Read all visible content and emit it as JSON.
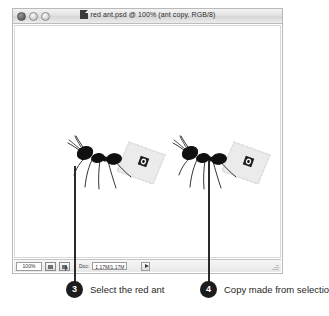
{
  "window": {
    "title": "red ant.psd @ 100% (ant copy, RGB/8)",
    "doc_icon": "photoshop-document-icon",
    "controls": [
      {
        "name": "close-button",
        "label": ""
      },
      {
        "name": "minimize-button",
        "label": ""
      },
      {
        "name": "zoom-button",
        "label": ""
      }
    ]
  },
  "statusbar": {
    "zoom_level": "100%",
    "doc_label": "Doc:",
    "doc_size": "1.17M/1.17M",
    "icons": [
      {
        "name": "preview-icon"
      },
      {
        "name": "export-icon"
      }
    ],
    "popup_arrow": "popup-menu-arrow-icon"
  },
  "canvas": {
    "objects": [
      {
        "name": "ant-original",
        "description": "red ant carrying perforated stamp"
      },
      {
        "name": "ant-copy",
        "description": "duplicated red ant carrying perforated stamp"
      }
    ]
  },
  "callouts": [
    {
      "number": "3",
      "text": "Select the red ant"
    },
    {
      "number": "4",
      "text": "Copy made from selection"
    }
  ],
  "colors": {
    "callout_badge": "#1c1c1c",
    "callout_line": "#2a2a2a",
    "text": "#1f1f1f",
    "window_chrome": "#e2e2e2",
    "canvas_bg": "#ffffff"
  }
}
